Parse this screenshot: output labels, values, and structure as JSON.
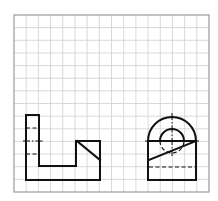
{
  "diagram": {
    "type": "orthographic-projection",
    "background": "#ffffff",
    "grid": {
      "x0": 14,
      "y0": 15,
      "x1": 209,
      "y1": 192,
      "cols": 16,
      "rows": 14,
      "line_color": "#cfcfcf",
      "border_color": "#9a9a9a"
    },
    "stroke": {
      "object_color": "#111111",
      "object_width": 2,
      "hidden_width": 1.2,
      "center_width": 1
    },
    "views": [
      {
        "name": "front-view",
        "outline": [
          [
            26,
            115
          ],
          [
            39,
            115
          ],
          [
            39,
            166
          ],
          [
            76,
            166
          ],
          [
            76,
            141
          ],
          [
            100,
            141
          ],
          [
            100,
            180
          ],
          [
            26,
            180
          ]
        ],
        "diagonal": [
          [
            77,
            141
          ],
          [
            100,
            160
          ]
        ],
        "hidden_lines": [
          [
            [
              26,
              128
            ],
            [
              39,
              128
            ]
          ],
          [
            [
              26,
              154
            ],
            [
              39,
              154
            ]
          ]
        ],
        "center_lines": [
          [
            [
              23,
              141
            ],
            [
              43,
              141
            ]
          ]
        ]
      },
      {
        "name": "side-view",
        "rect": {
          "x": 148,
          "y": 141,
          "w": 48,
          "h": 39
        },
        "outer_arc": {
          "cx": 172,
          "cy": 141,
          "r": 24
        },
        "inner_circle": {
          "cx": 172,
          "cy": 141,
          "r": 12,
          "upper_visible": true,
          "lower_hidden": true
        },
        "diagonal": [
          [
            149,
            160
          ],
          [
            196,
            141
          ]
        ],
        "hidden_lines": [
          [
            [
              149,
              167
            ],
            [
              195,
              167
            ]
          ]
        ],
        "center_lines": [
          [
            [
              145,
              141
            ],
            [
              199,
              141
            ]
          ],
          [
            [
              172,
              113
            ],
            [
              172,
              156
            ]
          ]
        ]
      }
    ]
  }
}
